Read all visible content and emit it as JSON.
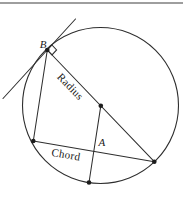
{
  "figure": {
    "labels": {
      "point_b": "B",
      "point_a": "A",
      "radius_label": "Radius",
      "chord_label": "Chord"
    },
    "colors": {
      "line": "#2e2e2e",
      "dot": "#1c1c1c",
      "top_rule": "#9e9e9e",
      "background": "#ffffff"
    }
  }
}
